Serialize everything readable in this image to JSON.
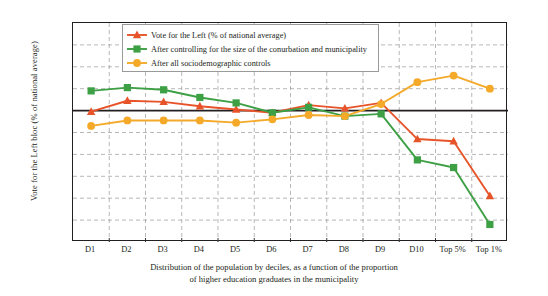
{
  "chart_data": {
    "type": "line",
    "title": "",
    "xlabel": "Distribution of the population by deciles, as a function of the proportion of higher education graduates in the municipality",
    "ylabel": "Vote for the Left bloc (% of national average)",
    "categories": [
      "D1",
      "D2",
      "D3",
      "D4",
      "D5",
      "D6",
      "D7",
      "D8",
      "D9",
      "D10",
      "Top 5%",
      "Top 1%"
    ],
    "ylim": [
      40,
      140
    ],
    "yticks": [
      "40%",
      "50%",
      "60%",
      "70%",
      "80%",
      "90%",
      "100%",
      "110%",
      "120%",
      "130%",
      "140%"
    ],
    "ytick_values": [
      40,
      50,
      60,
      70,
      80,
      90,
      100,
      110,
      120,
      130,
      140
    ],
    "grid": true,
    "legend_position": "top-center",
    "reference_line": 100,
    "series": [
      {
        "name": "Vote for the Left (% of national average)",
        "color": "#e8542a",
        "marker": "triangle",
        "values": [
          99.5,
          104.5,
          104,
          102,
          100.5,
          99,
          102.5,
          101,
          103.5,
          87,
          86,
          61
        ]
      },
      {
        "name": "After controlling for the size of the conurbation and municipality",
        "color": "#3ea045",
        "marker": "square",
        "values": [
          109,
          110.5,
          109.5,
          106,
          103.5,
          99,
          101.5,
          97.5,
          98.5,
          77.5,
          74,
          48
        ]
      },
      {
        "name": "After all sociodemographic controls",
        "color": "#f5a929",
        "marker": "circle",
        "values": [
          93,
          95.5,
          95.5,
          95.5,
          94.5,
          96,
          98,
          97.5,
          103,
          113,
          116,
          110
        ]
      }
    ]
  },
  "axis": {
    "y_title": "Vote for the Left bloc (% of national average)",
    "x_caption_line1": "Distribution of the population by deciles, as a function of the proportion",
    "x_caption_line2": "of higher education graduates in the municipality"
  },
  "colors": {
    "red": "#e8542a",
    "green": "#3ea045",
    "orange": "#f5a929",
    "axis": "#231f20",
    "grid": "#9a9a9a"
  }
}
